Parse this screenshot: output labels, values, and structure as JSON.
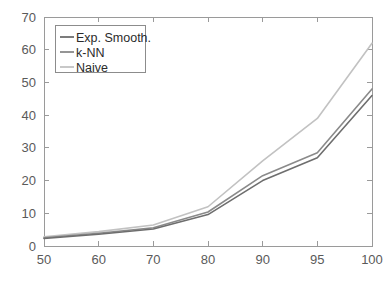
{
  "chart_data": {
    "type": "line",
    "title": "",
    "xlabel": "",
    "ylabel": "",
    "x": [
      50,
      60,
      70,
      80,
      90,
      95,
      100
    ],
    "categories": [
      "50",
      "60",
      "70",
      "80",
      "90",
      "95",
      "100"
    ],
    "xtick_labels": [
      "50",
      "60",
      "70",
      "80",
      "90",
      "95",
      "100"
    ],
    "ytick_labels": [
      "0",
      "10",
      "20",
      "30",
      "40",
      "50",
      "60",
      "70"
    ],
    "yticks": [
      0,
      10,
      20,
      30,
      40,
      50,
      60,
      70
    ],
    "ylim": [
      0,
      70
    ],
    "xlim_categorical": true,
    "grid": false,
    "legend_position": "top-left",
    "series": [
      {
        "name": "Exp. Smooth.",
        "color": "#6e6e6e",
        "values": [
          2.3,
          3.6,
          5.2,
          9.6,
          20.0,
          27.0,
          46.0
        ]
      },
      {
        "name": "k-NN",
        "color": "#8a8a8a",
        "values": [
          2.5,
          3.9,
          5.6,
          10.4,
          21.5,
          28.5,
          48.0
        ]
      },
      {
        "name": "Naive",
        "color": "#c2c2c2",
        "values": [
          2.8,
          4.4,
          6.4,
          12.0,
          26.0,
          39.0,
          62.0
        ]
      }
    ]
  },
  "legend": {
    "entries": [
      "Exp. Smooth.",
      "k-NN",
      "Naive"
    ]
  },
  "colors": {
    "axis": "#9a9a9a",
    "tick_text": "#5a5a5a",
    "legend_border": "#8c8c8c",
    "background": "#ffffff"
  }
}
